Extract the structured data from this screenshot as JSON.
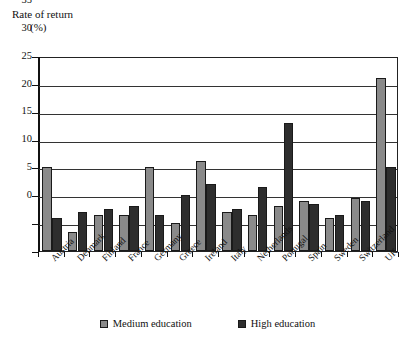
{
  "chart_data": {
    "type": "bar",
    "title": "Rate of return (%)",
    "title_line1": "Rate of return",
    "title_line2": "(%)",
    "xlabel": "",
    "ylabel": "",
    "ylim": [
      0,
      35
    ],
    "ytick_step": 5,
    "yticks": [
      0,
      5,
      10,
      15,
      20,
      25,
      30,
      35
    ],
    "grid": true,
    "legend_position": "bottom",
    "categories": [
      "Austria",
      "Denmark",
      "Finland",
      "France",
      "Germany",
      "Greece",
      "Ireland",
      "Italy",
      "Netherlands",
      "Portugal",
      "Spain",
      "Sweden",
      "Switzerland",
      "UK"
    ],
    "series": [
      {
        "name": "Medium education",
        "color": "#8a8a8a",
        "values": [
          15.0,
          3.5,
          6.5,
          6.5,
          15.0,
          5.0,
          16.2,
          7.0,
          6.5,
          8.0,
          9.0,
          6.0,
          9.5,
          31.0
        ]
      },
      {
        "name": "High education",
        "color": "#2e2e2e",
        "values": [
          6.0,
          7.0,
          7.5,
          8.0,
          6.5,
          10.0,
          12.0,
          7.5,
          11.5,
          23.0,
          8.5,
          6.5,
          9.0,
          15.0
        ]
      }
    ]
  },
  "legend": {
    "items": [
      {
        "label": "Medium education"
      },
      {
        "label": "High education"
      }
    ]
  }
}
